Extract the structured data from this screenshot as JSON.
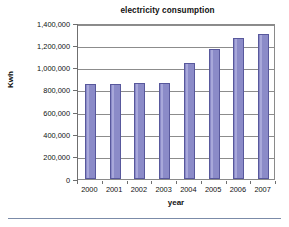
{
  "chart_data": {
    "type": "bar",
    "title": "electricity consumption",
    "xlabel": "year",
    "ylabel": "Kwh",
    "categories": [
      "2000",
      "2001",
      "2002",
      "2003",
      "2004",
      "2005",
      "2006",
      "2007"
    ],
    "values": [
      850000,
      855000,
      858000,
      858000,
      1040000,
      1170000,
      1270000,
      1305000
    ],
    "ylim": [
      0,
      1400000
    ],
    "ytick_values": [
      0,
      200000,
      400000,
      600000,
      800000,
      1000000,
      1200000,
      1400000
    ],
    "ytick_labels": [
      "0",
      "200,000",
      "400,000",
      "600,000",
      "800,000",
      "1,000,000",
      "1,200,000",
      "1,400,000"
    ],
    "grid": true,
    "legend": false,
    "series_color": "#8b8bc8",
    "series_border_color": "#58589c",
    "gridline_color": "#8c8c8c",
    "axis_color": "#6f6f6f",
    "background": "#ffffff"
  }
}
